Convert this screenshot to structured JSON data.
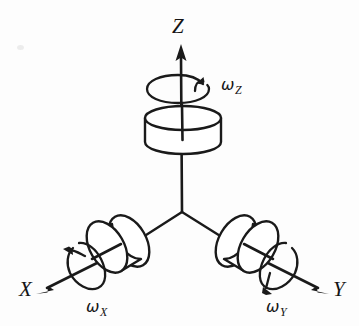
{
  "figure": {
    "background_color": "#fdfdfd",
    "ink_color": "#1a1a1a",
    "width": 359,
    "height": 326
  },
  "axes": [
    {
      "id": "z",
      "label": "Z",
      "label_x": 172,
      "label_y": 18,
      "direction": "up",
      "arrow_tip": [
        181,
        47
      ],
      "origin": [
        182,
        212
      ]
    },
    {
      "id": "x",
      "label": "X",
      "label_x": 20,
      "label_y": 280,
      "direction": "down-left",
      "arrow_tip": [
        40,
        292
      ],
      "origin": [
        182,
        212
      ]
    },
    {
      "id": "y",
      "label": "Y",
      "label_x": 333,
      "label_y": 280,
      "direction": "down-right",
      "arrow_tip": [
        325,
        292
      ],
      "origin": [
        182,
        212
      ]
    }
  ],
  "rotations": [
    {
      "id": "omega-z",
      "symbol": "ω",
      "subscript": "Z",
      "label_x": 222,
      "label_y": 77,
      "about_axis": "z",
      "arrow_sense": "counter-clockwise-about-z"
    },
    {
      "id": "omega-x",
      "symbol": "ω",
      "subscript": "X",
      "label_x": 86,
      "label_y": 299,
      "about_axis": "x",
      "arrow_sense": "about-x"
    },
    {
      "id": "omega-y",
      "symbol": "ω",
      "subscript": "Y",
      "label_x": 266,
      "label_y": 299,
      "about_axis": "y",
      "arrow_sense": "about-y"
    }
  ],
  "wheels": [
    {
      "id": "wheel-z",
      "mounted_on": "z",
      "shape": "cylinder",
      "center": [
        183,
        137
      ]
    },
    {
      "id": "wheel-x",
      "mounted_on": "x",
      "shape": "cylinder",
      "center": [
        119,
        248
      ]
    },
    {
      "id": "wheel-y",
      "mounted_on": "y",
      "shape": "cylinder",
      "center": [
        246,
        248
      ]
    }
  ],
  "hub": {
    "id": "hub",
    "center": [
      182,
      212
    ]
  }
}
